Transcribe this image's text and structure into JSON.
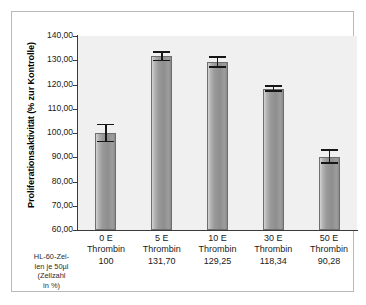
{
  "chart_data": {
    "type": "bar",
    "title": "",
    "subtitle": "",
    "xlabel": "",
    "ylabel": "Proliferationsaktivität (% zur Kontrolle)",
    "ylim": [
      60.0,
      140.0
    ],
    "ytick_labels": [
      "140,00",
      "130,00",
      "120,00",
      "110,00",
      "100,00",
      "90,00",
      "80,00",
      "70,00",
      "60,00"
    ],
    "ytick_values": [
      140,
      130,
      120,
      110,
      100,
      90,
      80,
      70,
      60
    ],
    "grid": false,
    "legend": "none",
    "categories": [
      "0 E Thrombin",
      "5 E Thrombin",
      "10 E Thrombin",
      "30 E Thrombin",
      "50 E Thrombin"
    ],
    "values": [
      100.0,
      131.7,
      129.25,
      118.34,
      90.28
    ],
    "errors": [
      3.9,
      2.2,
      2.4,
      1.3,
      3.1
    ],
    "bar_color": "#999999",
    "plot_background": "#f0f0f0",
    "axis_color": "#3a3a3a",
    "error_bar_color": "#161616"
  },
  "axis": {
    "y_label": "Proliferationsaktivität (% zur Kontrolle)",
    "ticks": [
      {
        "label": "140,00",
        "value": 140
      },
      {
        "label": "130,00",
        "value": 130
      },
      {
        "label": "120,00",
        "value": 120
      },
      {
        "label": "110,00",
        "value": 110
      },
      {
        "label": "100,00",
        "value": 100
      },
      {
        "label": "90,00",
        "value": 90
      },
      {
        "label": "80,00",
        "value": 80
      },
      {
        "label": "70,00",
        "value": 70
      },
      {
        "label": "60,00",
        "value": 60
      }
    ]
  },
  "x_categories": [
    {
      "dose": "0 E",
      "agent": "Thrombin",
      "value": "100"
    },
    {
      "dose": "5 E",
      "agent": "Thrombin",
      "value": "131,70"
    },
    {
      "dose": "10 E",
      "agent": "Thrombin",
      "value": "129,25"
    },
    {
      "dose": "30 E",
      "agent": "Thrombin",
      "value": "118,34"
    },
    {
      "dose": "50 E",
      "agent": "Thrombin",
      "value": "90,28"
    }
  ],
  "corner_caption": {
    "line1": "HL-60-Zel-",
    "line2": "len je 50µl",
    "line3": "(Zellzahl",
    "line4": "in %)"
  }
}
